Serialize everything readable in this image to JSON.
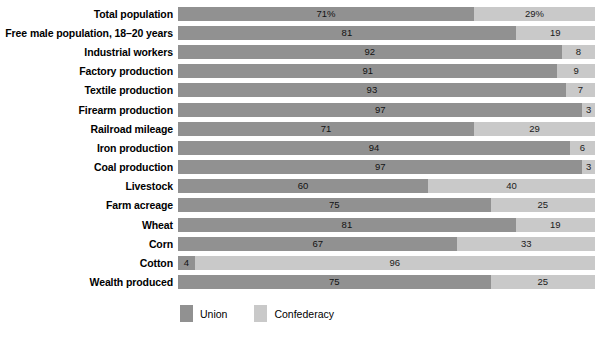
{
  "chart_data": {
    "type": "bar",
    "title": "",
    "subtitle": "",
    "xlabel": "",
    "ylabel": "",
    "orientation": "horizontal",
    "stacked": true,
    "normalized_percent": true,
    "xlim": [
      0,
      100
    ],
    "grid": false,
    "legend_position": "bottom-left",
    "categories": [
      "Total population",
      "Free male population, 18–20 years",
      "Industrial workers",
      "Factory production",
      "Textile production",
      "Firearm production",
      "Railroad mileage",
      "Iron production",
      "Coal production",
      "Livestock",
      "Farm acreage",
      "Wheat",
      "Corn",
      "Cotton",
      "Wealth produced"
    ],
    "series": [
      {
        "name": "Union",
        "color": "#919191",
        "values": [
          71,
          81,
          92,
          91,
          93,
          97,
          71,
          94,
          97,
          60,
          75,
          81,
          67,
          4,
          75
        ],
        "labels": [
          "71%",
          "81",
          "92",
          "91",
          "93",
          "97",
          "71",
          "94",
          "97",
          "60",
          "75",
          "81",
          "67",
          "4",
          "75"
        ]
      },
      {
        "name": "Confederacy",
        "color": "#c9c9c9",
        "values": [
          29,
          19,
          8,
          9,
          7,
          3,
          29,
          6,
          3,
          40,
          25,
          19,
          33,
          96,
          25
        ],
        "labels": [
          "29%",
          "19",
          "8",
          "9",
          "7",
          "3",
          "29",
          "6",
          "3",
          "40",
          "25",
          "19",
          "33",
          "96",
          "25"
        ]
      }
    ]
  },
  "legend": {
    "items": [
      {
        "label": "Union",
        "color": "#919191"
      },
      {
        "label": "Confederacy",
        "color": "#c9c9c9"
      }
    ]
  }
}
